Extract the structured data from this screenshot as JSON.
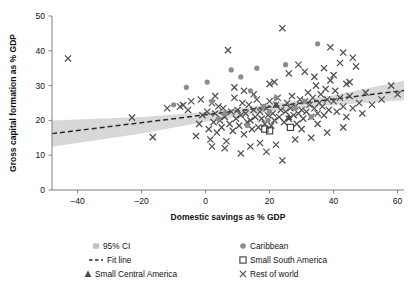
{
  "chart_data": {
    "type": "scatter",
    "title": "",
    "xlabel": "Domestic savings as % GDP",
    "ylabel": "Gross capital formation as % GDP",
    "xlim": [
      -48,
      62
    ],
    "ylim": [
      0,
      50
    ],
    "xticks": [
      -40,
      -20,
      0,
      20,
      40,
      60
    ],
    "xtick_labels": [
      "–40",
      "–20",
      "0",
      "20",
      "40",
      "60"
    ],
    "yticks": [
      0,
      10,
      20,
      30,
      40,
      50
    ],
    "ytick_labels": [
      "0",
      "10",
      "20",
      "30",
      "40",
      "50"
    ],
    "grid": false,
    "legend_position": "bottom",
    "colors": {
      "ci_band": "#c0c0c0",
      "fit_line": "#2a2a2a",
      "caribbean": "#8c8c8c",
      "small_south_america": "#3a3a3a",
      "small_central_america": "#4a4a4a",
      "rest_of_world": "#4f4f4f",
      "axis": "#808080",
      "text": "#111111"
    },
    "fit_line": {
      "label": "Fit line",
      "x_start": -48,
      "y_start": 16.2,
      "x_end": 62,
      "y_end": 28.6,
      "style": "dashed"
    },
    "ci_band": {
      "label": "95% CI",
      "upper": [
        [
          -48,
          20.0
        ],
        [
          -20,
          21.0
        ],
        [
          0,
          22.4
        ],
        [
          20,
          24.6
        ],
        [
          40,
          27.2
        ],
        [
          62,
          31.4
        ]
      ],
      "lower": [
        [
          -48,
          12.4
        ],
        [
          -20,
          16.2
        ],
        [
          0,
          19.6
        ],
        [
          20,
          22.6
        ],
        [
          40,
          24.4
        ],
        [
          62,
          25.8
        ]
      ]
    },
    "series": [
      {
        "name": "Rest of world",
        "marker": "x",
        "points": [
          [
            -43,
            37.8
          ],
          [
            -23,
            20.8
          ],
          [
            -16.5,
            15.2
          ],
          [
            -12.0,
            23.5
          ],
          [
            -8.0,
            24.0
          ],
          [
            -5.5,
            23.0
          ],
          [
            -4.5,
            25.5
          ],
          [
            -7.0,
            24.4
          ],
          [
            7.0,
            40.2
          ],
          [
            -2.0,
            19.0
          ],
          [
            -1.0,
            21.5
          ],
          [
            0.5,
            22.5
          ],
          [
            1.0,
            17.5
          ],
          [
            1.5,
            14.5
          ],
          [
            2.0,
            25.0
          ],
          [
            2.5,
            19.5
          ],
          [
            3.0,
            22.0
          ],
          [
            3.5,
            16.5
          ],
          [
            4.0,
            24.0
          ],
          [
            4.5,
            20.0
          ],
          [
            5.0,
            18.0
          ],
          [
            5.5,
            23.5
          ],
          [
            6.0,
            21.0
          ],
          [
            6.5,
            14.0
          ],
          [
            7.5,
            19.0
          ],
          [
            8.0,
            22.5
          ],
          [
            8.5,
            17.0
          ],
          [
            9.0,
            26.5
          ],
          [
            9.5,
            20.5
          ],
          [
            10.0,
            23.0
          ],
          [
            10.5,
            18.5
          ],
          [
            11.0,
            21.5
          ],
          [
            11.5,
            25.0
          ],
          [
            12.0,
            16.0
          ],
          [
            12.5,
            22.0
          ],
          [
            13.0,
            19.5
          ],
          [
            13.5,
            24.5
          ],
          [
            14.0,
            20.0
          ],
          [
            14.5,
            17.5
          ],
          [
            15.0,
            23.0
          ],
          [
            15.5,
            21.0
          ],
          [
            16.0,
            26.0
          ],
          [
            16.5,
            18.0
          ],
          [
            17.0,
            22.5
          ],
          [
            17.5,
            20.5
          ],
          [
            18.0,
            24.0
          ],
          [
            18.5,
            19.0
          ],
          [
            19.0,
            23.5
          ],
          [
            19.5,
            21.5
          ],
          [
            20.0,
            25.5
          ],
          [
            20.5,
            18.5
          ],
          [
            21.0,
            22.0
          ],
          [
            21.5,
            20.0
          ],
          [
            22.0,
            24.5
          ],
          [
            22.5,
            26.5
          ],
          [
            23.0,
            21.0
          ],
          [
            23.5,
            23.0
          ],
          [
            24.0,
            46.5
          ],
          [
            24.5,
            19.5
          ],
          [
            25.0,
            22.5
          ],
          [
            25.5,
            25.0
          ],
          [
            26.0,
            20.5
          ],
          [
            26.5,
            23.5
          ],
          [
            27.0,
            27.0
          ],
          [
            27.5,
            21.5
          ],
          [
            28.0,
            24.0
          ],
          [
            28.5,
            19.0
          ],
          [
            29.0,
            22.0
          ],
          [
            29.5,
            26.0
          ],
          [
            30.0,
            23.0
          ],
          [
            30.5,
            20.5
          ],
          [
            31.0,
            25.5
          ],
          [
            31.5,
            22.5
          ],
          [
            32.0,
            28.0
          ],
          [
            32.5,
            24.5
          ],
          [
            33.0,
            21.0
          ],
          [
            33.5,
            26.5
          ],
          [
            34.0,
            23.5
          ],
          [
            34.5,
            30.0
          ],
          [
            35.0,
            22.0
          ],
          [
            35.5,
            25.0
          ],
          [
            36.0,
            27.5
          ],
          [
            36.5,
            24.0
          ],
          [
            37.0,
            21.5
          ],
          [
            37.5,
            29.0
          ],
          [
            38.0,
            26.0
          ],
          [
            38.5,
            23.0
          ],
          [
            39.0,
            31.5
          ],
          [
            40.0,
            25.5
          ],
          [
            40.5,
            28.5
          ],
          [
            41.0,
            22.5
          ],
          [
            42.0,
            26.5
          ],
          [
            43.0,
            24.0
          ],
          [
            44.0,
            30.5
          ],
          [
            45.0,
            27.0
          ],
          [
            46.0,
            23.5
          ],
          [
            47.0,
            35.5
          ],
          [
            48.0,
            25.0
          ],
          [
            50.0,
            28.0
          ],
          [
            52.0,
            24.5
          ],
          [
            55.0,
            26.0
          ],
          [
            58.0,
            30.0
          ],
          [
            60.0,
            27.5
          ],
          [
            11.0,
            10.5
          ],
          [
            19.0,
            11.0
          ],
          [
            6.0,
            12.0
          ],
          [
            14.0,
            12.5
          ],
          [
            22.0,
            13.0
          ],
          [
            28.0,
            14.5
          ],
          [
            33.0,
            15.0
          ],
          [
            38.0,
            16.5
          ],
          [
            43.0,
            18.0
          ],
          [
            2.0,
            12.5
          ],
          [
            -3.0,
            15.5
          ],
          [
            24.0,
            8.5
          ],
          [
            17.0,
            13.5
          ],
          [
            30.0,
            17.5
          ],
          [
            35.0,
            19.0
          ],
          [
            44.0,
            21.0
          ],
          [
            49.0,
            22.0
          ],
          [
            20.0,
            30.5
          ],
          [
            21.5,
            31.0
          ],
          [
            26.0,
            33.5
          ],
          [
            29.0,
            36.0
          ],
          [
            31.0,
            34.0
          ],
          [
            34.0,
            32.5
          ],
          [
            37.0,
            35.0
          ],
          [
            40.0,
            33.0
          ],
          [
            42.0,
            36.5
          ],
          [
            45.0,
            31.0
          ],
          [
            12.0,
            28.5
          ],
          [
            15.0,
            27.5
          ],
          [
            9.0,
            29.5
          ],
          [
            3.0,
            27.0
          ],
          [
            -1.5,
            26.0
          ],
          [
            46.0,
            38.0
          ],
          [
            43.0,
            39.5
          ],
          [
            39.0,
            41.0
          ]
        ]
      },
      {
        "name": "Caribbean",
        "marker": "circle-filled",
        "points": [
          [
            -6.0,
            29.5
          ],
          [
            -10.0,
            24.5
          ],
          [
            0.5,
            31.0
          ],
          [
            2.0,
            25.5
          ],
          [
            8.0,
            34.5
          ],
          [
            11.0,
            32.5
          ],
          [
            14.0,
            28.5
          ],
          [
            16.0,
            35.0
          ],
          [
            18.0,
            24.0
          ],
          [
            20.0,
            22.5
          ],
          [
            22.0,
            26.5
          ],
          [
            25.0,
            36.0
          ],
          [
            28.0,
            23.5
          ],
          [
            31.0,
            25.5
          ],
          [
            33.0,
            21.0
          ],
          [
            13.0,
            18.5
          ],
          [
            6.0,
            22.0
          ],
          [
            19.5,
            20.0
          ],
          [
            35.0,
            42.0
          ],
          [
            4.0,
            20.5
          ]
        ]
      },
      {
        "name": "Small South America",
        "marker": "square-open",
        "points": [
          [
            18.5,
            17.5
          ],
          [
            20.0,
            17.0
          ],
          [
            26.5,
            18.0
          ]
        ]
      },
      {
        "name": "Small Central America",
        "marker": "triangle-filled",
        "points": [
          [
            26.0,
            21.0
          ],
          [
            22.0,
            24.5
          ]
        ]
      }
    ],
    "legend": [
      {
        "label": "95% CI",
        "marker": "band-square"
      },
      {
        "label": "Caribbean",
        "marker": "circle-filled"
      },
      {
        "label": "Fit line",
        "marker": "dashed-line"
      },
      {
        "label": "Small South America",
        "marker": "square-open"
      },
      {
        "label": "Small Central America",
        "marker": "triangle-filled"
      },
      {
        "label": "Rest of world",
        "marker": "x"
      }
    ]
  }
}
